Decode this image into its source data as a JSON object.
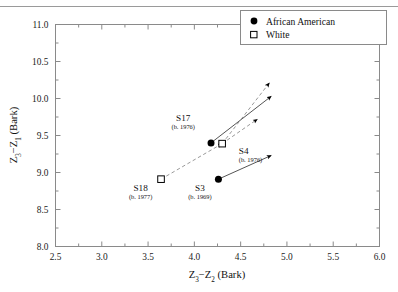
{
  "chart_data": {
    "type": "scatter",
    "title": "",
    "xlabel": "Z3-Z2 (Bark)",
    "ylabel": "Z3-Z1 (Bark)",
    "xlabel_parts": {
      "a": "Z",
      "a_sub": "3",
      "dash": "−",
      "b": "Z",
      "b_sub": "2",
      "unit": "(Bark)"
    },
    "ylabel_parts": {
      "a": "Z",
      "a_sub": "3",
      "dash": "−",
      "b": "Z",
      "b_sub": "1",
      "unit": "(Bark)"
    },
    "xlim": [
      2.5,
      6.0
    ],
    "ylim": [
      8.0,
      11.0
    ],
    "xticks": [
      "2.5",
      "3.0",
      "3.5",
      "4.0",
      "4.5",
      "5.0",
      "5.5",
      "6.0"
    ],
    "xtick_values": [
      2.5,
      3.0,
      3.5,
      4.0,
      4.5,
      5.0,
      5.5,
      6.0
    ],
    "yticks": [
      "8.0",
      "8.5",
      "9.0",
      "9.5",
      "10.0",
      "10.5",
      "11.0"
    ],
    "ytick_values": [
      8.0,
      8.5,
      9.0,
      9.5,
      10.0,
      10.5,
      11.0
    ],
    "minor_tick_step": 0.25,
    "grid": false,
    "legend_position": "top-right",
    "legend": [
      {
        "label": "African American",
        "marker": "filled-circle"
      },
      {
        "label": "White",
        "marker": "open-square"
      }
    ],
    "series": [
      {
        "name": "African American",
        "marker": "filled-circle",
        "line_style": "solid",
        "points": [
          {
            "id": "S17",
            "label": "S17",
            "sublabel": "(b. 1976)",
            "x": 4.18,
            "y": 9.4,
            "label_dx": -0.3,
            "label_dy": 0.3,
            "arrows": [
              {
                "x": 4.83,
                "y": 10.03
              }
            ]
          },
          {
            "id": "S3",
            "label": "S3",
            "sublabel": "(b. 1969)",
            "x": 4.26,
            "y": 8.91,
            "label_dx": -0.2,
            "label_dy": -0.16,
            "arrows": [
              {
                "x": 4.83,
                "y": 9.23
              }
            ]
          }
        ]
      },
      {
        "name": "White",
        "marker": "open-square",
        "line_style": "dashed",
        "points": [
          {
            "id": "S4",
            "label": "S4",
            "sublabel": "(b. 1976)",
            "x": 4.3,
            "y": 9.39,
            "label_dx": 0.18,
            "label_dy": -0.14,
            "arrows": [
              {
                "x": 4.81,
                "y": 10.21
              },
              {
                "x": 4.68,
                "y": 9.72
              }
            ]
          },
          {
            "id": "S18",
            "label": "S18",
            "sublabel": "(b. 1977)",
            "x": 3.64,
            "y": 8.91,
            "label_dx": -0.22,
            "label_dy": -0.16,
            "arrows": [
              {
                "x": 4.3,
                "y": 9.39
              }
            ]
          }
        ]
      }
    ]
  },
  "legend": {
    "items": [
      {
        "label": "African American"
      },
      {
        "label": "White"
      }
    ]
  },
  "axes": {
    "x": {
      "ticks": [
        "2.5",
        "3.0",
        "3.5",
        "4.0",
        "4.5",
        "5.0",
        "5.5",
        "6.0"
      ],
      "title_a": "Z",
      "title_a_sub": "3",
      "title_dash": "−",
      "title_b": "Z",
      "title_b_sub": "2",
      "title_unit": "(Bark)"
    },
    "y": {
      "ticks": [
        "8.0",
        "8.5",
        "9.0",
        "9.5",
        "10.0",
        "10.5",
        "11.0"
      ],
      "title_a": "Z",
      "title_a_sub": "3",
      "title_dash": "−",
      "title_b": "Z",
      "title_b_sub": "1",
      "title_unit": "(Bark)"
    }
  },
  "colors": {
    "frame": "#8a8a8a",
    "marker": "#000000",
    "solid_line": "#555555",
    "dashed_line": "#9a9a9a",
    "text": "#111111",
    "rule": "#9a9a9a"
  }
}
